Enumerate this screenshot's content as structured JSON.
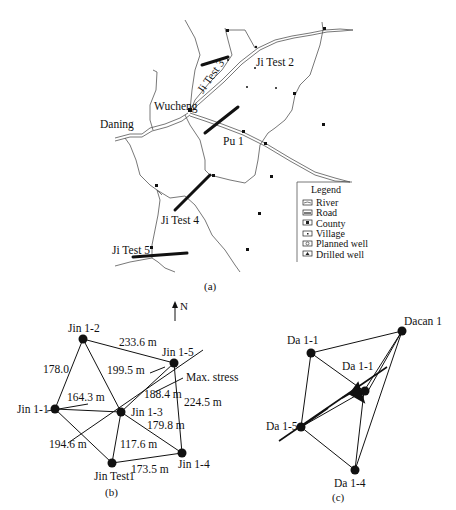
{
  "panel_a": {
    "caption": "(a)",
    "place_labels": {
      "wucheng": "Wucheng",
      "daning": "Daning",
      "pu1": "Pu 1",
      "ji_test_2": "Ji Test 2",
      "ji_test_3": "Ji Test 3",
      "ji_test_4": "Ji Test 4",
      "ji_test_5": "Ji Test 5"
    },
    "legend": {
      "title": "Legend",
      "items": [
        "River",
        "Road",
        "County",
        "Village",
        "Planned well",
        "Drilled well"
      ]
    }
  },
  "north_arrow": {
    "label": "N"
  },
  "panel_b": {
    "caption": "(b)",
    "wells": {
      "jin_1_1": "Jin 1-1",
      "jin_1_2": "Jin 1-2",
      "jin_1_3": "Jin 1-3",
      "jin_1_4": "Jin 1-4",
      "jin_1_5": "Jin 1-5",
      "jin_test1": "Jin Test1"
    },
    "distances": {
      "d_12_15": "233.6 m",
      "d_11_12": "178.0",
      "d_12_13": "199.5 m",
      "d_11_13": "164.3 m",
      "d_13_15": "188.4 m",
      "d_15_14": "224.5 m",
      "d_13_14": "179.8 m",
      "d_11_t1": "194.6 m",
      "d_13_t1": "117.6 m",
      "d_t1_14": "173.5 m"
    },
    "stress_label": "Max. stress"
  },
  "panel_c": {
    "caption": "(c)",
    "wells": {
      "da_1_1_left": "Da 1-1",
      "da_1_1_center": "Da 1-1",
      "dacan_1": "Dacan 1",
      "da_1_5": "Da 1-5",
      "da_1_4": "Da 1-4"
    }
  }
}
